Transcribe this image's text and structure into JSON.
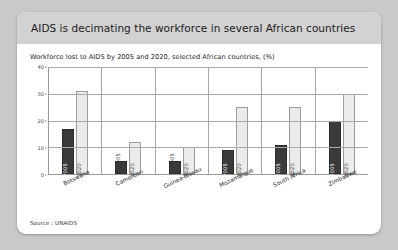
{
  "slide": {
    "title": "AIDS is decimating the workforce in several African countries",
    "subtitle": "Workforce lost to AIDS by 2005 and 2020, selected African countries, (%)",
    "source": "Source : UNAIDS"
  },
  "colors": {
    "page_background": "#c9c9c9",
    "slide_background": "#ffffff",
    "header_band": "#d2d2d2",
    "series_2005": "#3a3a3a",
    "series_2020": "#ebebeb",
    "axis": "#9a9a9a",
    "gridline": "#a8a8a8",
    "title_text": "#1c1c1c"
  },
  "chart_data": {
    "type": "bar",
    "title": "Workforce lost to AIDS by 2005 and 2020, selected African countries, (%)",
    "xlabel": "",
    "ylabel": "",
    "ylim": [
      0,
      40
    ],
    "yticks": [
      0,
      10,
      20,
      30,
      40
    ],
    "ytick_labels": [
      "0",
      "10",
      "20",
      "30",
      "40"
    ],
    "grid": true,
    "legend": "none",
    "categories": [
      "Botswana",
      "Cameroon",
      "Guinea-Bissau",
      "Mozambique",
      "South Africa",
      "Zimbabwe"
    ],
    "series": [
      {
        "name": "2005",
        "values": [
          17,
          5,
          5,
          9,
          11,
          20
        ],
        "label_position": [
          "inside",
          "above",
          "above",
          "inside",
          "inside",
          "inside"
        ]
      },
      {
        "name": "2020",
        "values": [
          31,
          12,
          10,
          25,
          25,
          30
        ],
        "label_position": [
          "inside",
          "inside",
          "inside",
          "inside",
          "inside",
          "inside"
        ]
      }
    ],
    "source": "Source : UNAIDS"
  }
}
